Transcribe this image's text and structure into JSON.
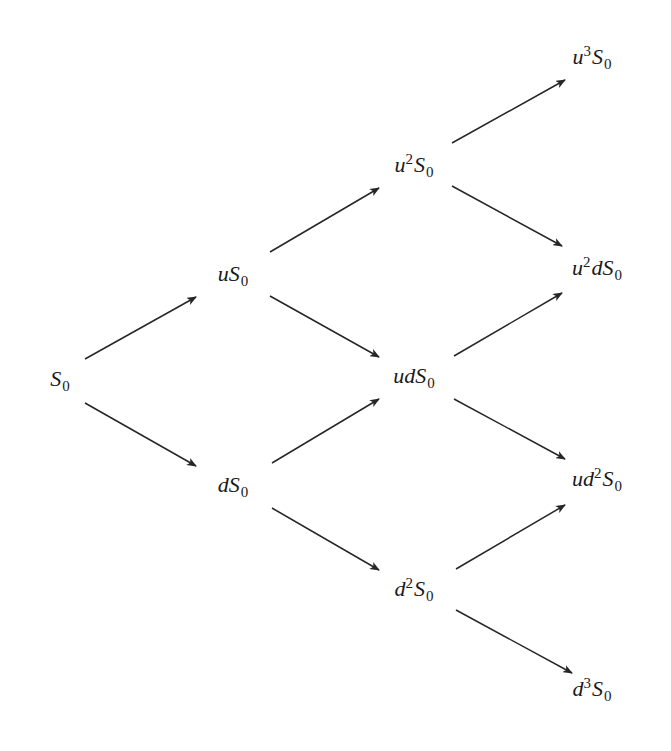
{
  "diagram": {
    "type": "binomial-tree",
    "title": "",
    "stroke_color": "#262626",
    "text_color": "#1a1a1a",
    "background": "#ffffff",
    "nodes": [
      {
        "id": "S0",
        "label": "S_0",
        "prefix": "",
        "power": "",
        "mid": "",
        "x": 60,
        "y": 381,
        "step": 0
      },
      {
        "id": "uS0",
        "label": "uS_0",
        "prefix": "u",
        "power": "",
        "mid": "",
        "x": 233,
        "y": 276,
        "step": 1
      },
      {
        "id": "dS0",
        "label": "dS_0",
        "prefix": "d",
        "power": "",
        "mid": "",
        "x": 233,
        "y": 487,
        "step": 1
      },
      {
        "id": "u2S0",
        "label": "u^2S_0",
        "prefix": "u",
        "power": "2",
        "mid": "",
        "x": 414,
        "y": 166,
        "step": 2
      },
      {
        "id": "udS0",
        "label": "udS_0",
        "prefix": "ud",
        "power": "",
        "mid": "",
        "x": 414,
        "y": 378,
        "step": 2
      },
      {
        "id": "d2S0",
        "label": "d^2S_0",
        "prefix": "d",
        "power": "2",
        "mid": "",
        "x": 414,
        "y": 590,
        "step": 2
      },
      {
        "id": "u3S0",
        "label": "u^3S_0",
        "prefix": "u",
        "power": "3",
        "mid": "",
        "x": 592,
        "y": 58,
        "step": 3
      },
      {
        "id": "u2dS0",
        "label": "u^2dS_0",
        "prefix": "u",
        "power": "2",
        "mid": "d",
        "x": 597,
        "y": 269,
        "step": 3
      },
      {
        "id": "ud2S0",
        "label": "ud^2S_0",
        "prefix": "ud",
        "power": "2",
        "mid": "",
        "x": 597,
        "y": 480,
        "step": 3
      },
      {
        "id": "d3S0",
        "label": "d^3S_0",
        "prefix": "d",
        "power": "3",
        "mid": "",
        "x": 592,
        "y": 690,
        "step": 3
      }
    ],
    "edges": [
      {
        "from": "S0",
        "to": "uS0",
        "x1": 85,
        "y1": 359,
        "x2": 196,
        "y2": 297
      },
      {
        "from": "S0",
        "to": "dS0",
        "x1": 85,
        "y1": 403,
        "x2": 196,
        "y2": 466
      },
      {
        "from": "uS0",
        "to": "u2S0",
        "x1": 270,
        "y1": 252,
        "x2": 379,
        "y2": 188
      },
      {
        "from": "uS0",
        "to": "udS0",
        "x1": 270,
        "y1": 296,
        "x2": 379,
        "y2": 357
      },
      {
        "from": "dS0",
        "to": "udS0",
        "x1": 272,
        "y1": 463,
        "x2": 379,
        "y2": 399
      },
      {
        "from": "dS0",
        "to": "d2S0",
        "x1": 272,
        "y1": 508,
        "x2": 379,
        "y2": 570
      },
      {
        "from": "u2S0",
        "to": "u3S0",
        "x1": 452,
        "y1": 143,
        "x2": 565,
        "y2": 80
      },
      {
        "from": "u2S0",
        "to": "u2dS0",
        "x1": 452,
        "y1": 186,
        "x2": 562,
        "y2": 246
      },
      {
        "from": "udS0",
        "to": "u2dS0",
        "x1": 454,
        "y1": 356,
        "x2": 562,
        "y2": 293
      },
      {
        "from": "udS0",
        "to": "ud2S0",
        "x1": 454,
        "y1": 399,
        "x2": 565,
        "y2": 459
      },
      {
        "from": "d2S0",
        "to": "ud2S0",
        "x1": 456,
        "y1": 569,
        "x2": 565,
        "y2": 505
      },
      {
        "from": "d2S0",
        "to": "d3S0",
        "x1": 456,
        "y1": 610,
        "x2": 572,
        "y2": 673
      }
    ],
    "subscript": "0",
    "base_symbol": "S"
  }
}
